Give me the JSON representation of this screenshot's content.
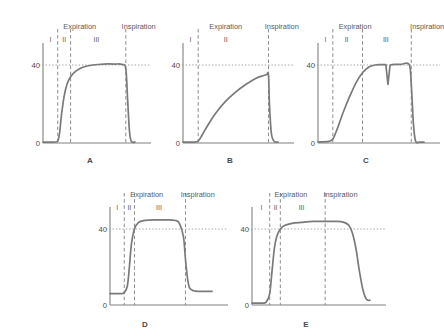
{
  "figure": {
    "background_color": "#ffffff",
    "trace_color": "#7a7a7a",
    "axis_color": "#808080",
    "dashed_color": "#8c8c8c",
    "dotted_color": "#9a9a9a",
    "text_color": "#4a4a4a"
  },
  "labels": {
    "expiration": "Expiration",
    "inspiration": "Inspiration",
    "phase_1": "I",
    "phase_2": "II",
    "phase_3": "III",
    "y_tick_40": "40",
    "y_tick_0": "0"
  },
  "panels": [
    {
      "letter": "A",
      "phases": [
        "I",
        "II",
        "III"
      ],
      "headers": [
        "Expiration",
        "Inspiration"
      ],
      "y_ticks": [
        "40",
        "0"
      ],
      "description": "normal capnogram: rapid upstroke, flat alveolar plateau at 40, rapid downstroke"
    },
    {
      "letter": "B",
      "phases": [
        "I",
        "II"
      ],
      "headers": [
        "Expiration",
        "Inspiration"
      ],
      "y_ticks": [
        "40",
        "0"
      ],
      "description": "obstructive pattern: prolonged shark-fin upstroke, no plateau, peak below 40"
    },
    {
      "letter": "C",
      "phases": [
        "I",
        "II",
        "III"
      ],
      "headers": [
        "Expiration",
        "Inspiration"
      ],
      "y_ticks": [
        "40",
        "0"
      ],
      "description": "curare cleft: notch dipping within the alveolar plateau at 40"
    },
    {
      "letter": "D",
      "phases": [
        "I",
        "II",
        "III"
      ],
      "headers": [
        "Expiration",
        "Inspiration"
      ],
      "y_ticks": [
        "40",
        "0"
      ],
      "description": "rebreathing: elevated baseline above zero, plateau above 40"
    },
    {
      "letter": "E",
      "phases": [
        "I",
        "II",
        "III"
      ],
      "headers": [
        "Expiration",
        "Inspiration"
      ],
      "y_ticks": [
        "40",
        "0"
      ],
      "description": "prolonged plateau extending past inspiration with slanted late downstroke"
    }
  ],
  "chart_data": {
    "type": "line",
    "xlabel": "",
    "ylabel": "",
    "ylim": [
      0,
      58
    ],
    "grid": false,
    "legend": "none",
    "y_tick_values": [
      0,
      40
    ],
    "panels": [
      {
        "id": "A",
        "label": "A",
        "x": [
          0,
          12,
          16,
          18,
          20,
          23,
          26,
          30,
          36,
          44,
          54,
          66,
          78,
          86,
          90,
          92,
          94,
          96,
          100
        ],
        "y": [
          0.5,
          0.5,
          1,
          5,
          14,
          24,
          30,
          34,
          37,
          39,
          40,
          40.5,
          40.5,
          40.3,
          38,
          22,
          6,
          0.8,
          0.5
        ],
        "phase_boundaries": [
          16,
          30,
          90
        ],
        "phase_labels": [
          {
            "text": "I",
            "x": 8
          },
          {
            "text": "II",
            "x": 23
          },
          {
            "text": "III",
            "x": 58
          }
        ],
        "header_labels": [
          {
            "text": "Expiration",
            "x": 40
          },
          {
            "text": "Inspiration",
            "x": 104
          }
        ],
        "reference_line_y": 40
      },
      {
        "id": "B",
        "label": "B",
        "x": [
          0,
          12,
          16,
          20,
          26,
          34,
          44,
          55,
          66,
          76,
          84,
          88,
          90,
          91,
          93,
          96,
          100
        ],
        "y": [
          0.5,
          0.5,
          1,
          4,
          9,
          15,
          21,
          26,
          30,
          33,
          34.5,
          35,
          35,
          20,
          5,
          0.8,
          0.5
        ],
        "phase_boundaries": [
          16,
          90
        ],
        "phase_labels": [
          {
            "text": "I",
            "x": 8
          },
          {
            "text": "II",
            "x": 45
          }
        ],
        "header_labels": [
          {
            "text": "Expiration",
            "x": 45
          },
          {
            "text": "Inspiration",
            "x": 104
          }
        ],
        "reference_line_y": 40
      },
      {
        "id": "C",
        "label": "C",
        "x": [
          0,
          10,
          14,
          18,
          24,
          30,
          36,
          42,
          48,
          54,
          58,
          62,
          64,
          66,
          68,
          70,
          72,
          78,
          86,
          88,
          90,
          92,
          96,
          100
        ],
        "y": [
          0.5,
          0.8,
          2,
          7,
          16,
          24,
          31,
          36,
          39,
          40,
          40.2,
          40.2,
          40.2,
          30,
          40,
          40.2,
          40.3,
          40.3,
          40.3,
          30,
          10,
          1,
          0.5,
          0.5
        ],
        "phase_boundaries": [
          14,
          42,
          88
        ],
        "phase_labels": [
          {
            "text": "I",
            "x": 7
          },
          {
            "text": "II",
            "x": 27
          },
          {
            "text": "III",
            "x": 64
          }
        ],
        "header_labels": [
          {
            "text": "Expiration",
            "x": 35
          },
          {
            "text": "Inspiration",
            "x": 103
          }
        ],
        "reference_line_y": 40,
        "notch": {
          "x": 66,
          "depth": 10
        }
      },
      {
        "id": "D",
        "label": "D",
        "x": [
          0,
          10,
          14,
          17,
          19,
          21,
          24,
          28,
          34,
          44,
          56,
          64,
          68,
          72,
          74,
          76,
          78,
          82,
          88,
          100
        ],
        "y": [
          6,
          6,
          6.5,
          10,
          20,
          32,
          40,
          43.5,
          44.5,
          44.8,
          44.8,
          44.5,
          43,
          36,
          24,
          14,
          9,
          7.5,
          7.2,
          7.2
        ],
        "phase_boundaries": [
          14,
          24,
          74
        ],
        "phase_labels": [
          {
            "text": "I",
            "x": 7
          },
          {
            "text": "II",
            "x": 19
          },
          {
            "text": "III",
            "x": 48
          }
        ],
        "header_labels": [
          {
            "text": "Expiration",
            "x": 36
          },
          {
            "text": "Inspiration",
            "x": 86
          }
        ],
        "reference_line_y": 40,
        "elevated_baseline": 6
      },
      {
        "id": "E",
        "label": "E",
        "x": [
          0,
          8,
          12,
          15,
          17,
          19,
          21,
          24,
          28,
          34,
          42,
          52,
          62,
          72,
          78,
          82,
          85,
          88,
          91,
          94,
          97,
          100
        ],
        "y": [
          1,
          1,
          1.5,
          6,
          18,
          30,
          36,
          40,
          42,
          43,
          43.5,
          44,
          44,
          44,
          43.5,
          42,
          38,
          30,
          18,
          8,
          3,
          2.5
        ],
        "phase_boundaries": [
          15,
          24,
          62
        ],
        "phase_labels": [
          {
            "text": "I",
            "x": 8
          },
          {
            "text": "II",
            "x": 20
          },
          {
            "text": "III",
            "x": 42
          }
        ],
        "header_labels": [
          {
            "text": "Expiration",
            "x": 33
          },
          {
            "text": "Inspiration",
            "x": 75
          }
        ],
        "reference_line_y": 40
      }
    ]
  }
}
